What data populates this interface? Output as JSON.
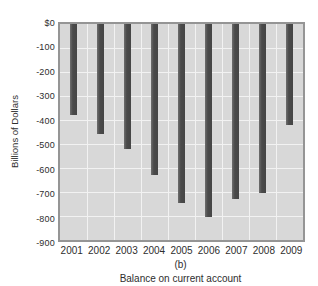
{
  "chart_data": {
    "type": "bar",
    "categories": [
      "2001",
      "2002",
      "2003",
      "2004",
      "2005",
      "2006",
      "2007",
      "2008",
      "2009"
    ],
    "values": [
      -380,
      -460,
      -520,
      -630,
      -745,
      -805,
      -730,
      -705,
      -420
    ],
    "title": "",
    "subcaption": "(b)",
    "xlabel": "Balance on current account",
    "ylabel": "Billions of Dollars",
    "y_ticks": [
      "$0",
      "-100",
      "-200",
      "-300",
      "-400",
      "-500",
      "-600",
      "-700",
      "-800",
      "-900"
    ],
    "ylim": [
      -900,
      0
    ],
    "grid": true,
    "legend": false,
    "colors": {
      "bar": "#4a4a4a",
      "plot_background": "#d8d8d8",
      "gridline": "#f2f2f2",
      "plot_border": "#959595",
      "text": "#2e2e2e",
      "page_background": "#ffffff"
    }
  }
}
